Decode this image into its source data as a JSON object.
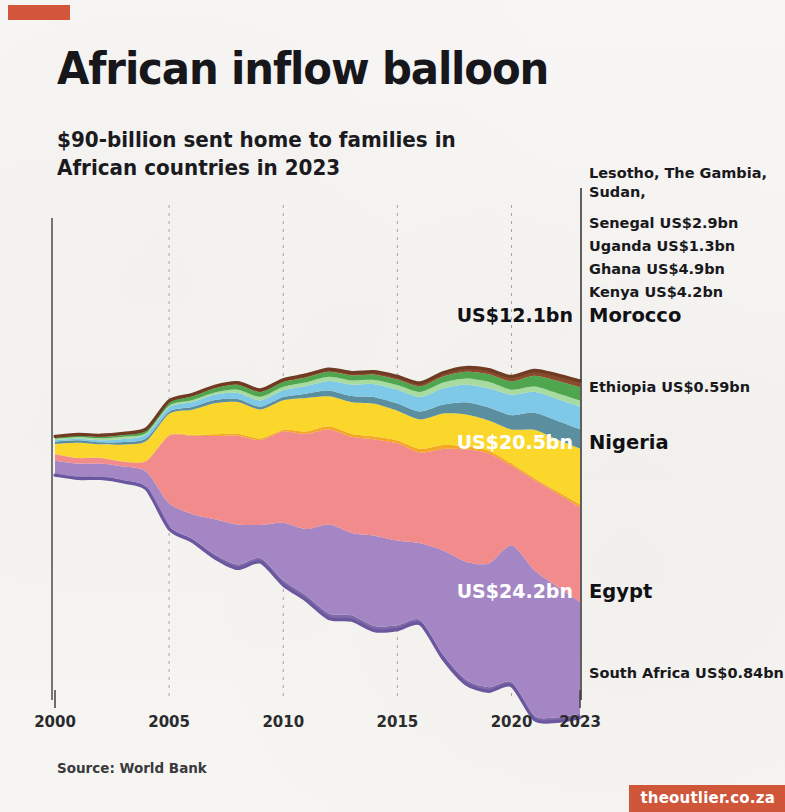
{
  "header": {
    "accent_bar_color": "#d2563a",
    "title": "African inflow balloon",
    "subtitle": "$90-billion sent home to families in\nAfrican countries in 2023"
  },
  "footer": {
    "source": "Source: World Bank",
    "badge": "theoutlier.co.za",
    "badge_color": "#cf5639"
  },
  "chart_data": {
    "type": "area",
    "title": "African inflow balloon",
    "subtitle": "$90-billion sent home to families in African countries in 2023",
    "xlabel": "",
    "ylabel": "",
    "grid": false,
    "legend_position": "right-inline",
    "units": "US$ billions",
    "x": [
      2000,
      2001,
      2002,
      2003,
      2004,
      2005,
      2006,
      2007,
      2008,
      2009,
      2010,
      2011,
      2012,
      2013,
      2014,
      2015,
      2016,
      2017,
      2018,
      2019,
      2020,
      2021,
      2022,
      2023
    ],
    "xticks": [
      "2000",
      "2005",
      "2010",
      "2015",
      "2020",
      "2023"
    ],
    "xtick_values": [
      2000,
      2005,
      2010,
      2015,
      2020,
      2023
    ],
    "stack_order_top_to_bottom": [
      "Lesotho, The Gambia, Sudan",
      "Senegal",
      "Uganda",
      "Ghana",
      "Kenya",
      "Morocco",
      "Ethiopia",
      "Nigeria",
      "Egypt",
      "South Africa"
    ],
    "series": [
      {
        "name": "South Africa",
        "label": "South Africa US$0.84bn",
        "value_2023": 0.84,
        "color": "#7f6aa8",
        "values": [
          0.3,
          0.32,
          0.35,
          0.38,
          0.42,
          0.5,
          0.58,
          0.7,
          0.85,
          0.9,
          1.0,
          1.05,
          1.1,
          1.05,
          1.0,
          0.95,
          0.88,
          0.9,
          0.92,
          0.9,
          0.78,
          0.82,
          0.86,
          0.84
        ]
      },
      {
        "name": "Egypt",
        "label": "Egypt",
        "value_label": "US$24.2bn",
        "value_2023": 24.2,
        "color": "#a586c4",
        "values": [
          2.85,
          2.91,
          2.89,
          2.96,
          3.34,
          5.02,
          5.33,
          7.66,
          8.69,
          7.15,
          12.45,
          14.32,
          19.24,
          17.83,
          19.57,
          18.33,
          16.58,
          22.52,
          25.52,
          26.78,
          29.6,
          31.49,
          28.33,
          24.2
        ]
      },
      {
        "name": "Nigeria",
        "label": "Nigeria",
        "value_label": "US$20.5bn",
        "value_2023": 20.5,
        "color": "#f28c8c",
        "values": [
          1.39,
          1.17,
          1.21,
          1.06,
          2.27,
          14.64,
          16.93,
          18.01,
          19.21,
          18.37,
          19.75,
          20.62,
          20.63,
          20.8,
          20.83,
          21.06,
          19.67,
          22.0,
          24.31,
          23.81,
          17.21,
          19.5,
          20.13,
          20.5
        ]
      },
      {
        "name": "Ethiopia",
        "label": "Ethiopia US$0.59bn",
        "value_2023": 0.59,
        "color": "#f5a623",
        "values": [
          0.05,
          0.05,
          0.06,
          0.1,
          0.13,
          0.17,
          0.17,
          0.36,
          0.39,
          0.35,
          0.35,
          0.51,
          0.62,
          0.63,
          0.65,
          0.62,
          0.77,
          0.85,
          0.68,
          0.59,
          0.48,
          0.42,
          0.48,
          0.59
        ]
      },
      {
        "name": "Morocco",
        "label": "Morocco",
        "value_label": "US$12.1bn",
        "value_2023": 12.1,
        "color": "#fbd72b",
        "values": [
          2.16,
          3.26,
          2.88,
          3.61,
          4.22,
          4.59,
          5.45,
          6.73,
          6.89,
          6.27,
          6.42,
          7.26,
          6.51,
          6.88,
          7.04,
          6.41,
          6.36,
          6.8,
          6.86,
          6.56,
          7.38,
          10.45,
          11.18,
          12.1
        ]
      },
      {
        "name": "Kenya",
        "label": "Kenya US$4.2bn",
        "value_2023": 4.2,
        "color": "#5b8fa0",
        "values": [
          0.54,
          0.55,
          0.43,
          0.54,
          0.62,
          0.43,
          0.57,
          0.67,
          0.67,
          0.61,
          0.69,
          0.93,
          1.22,
          1.31,
          1.44,
          1.57,
          1.72,
          1.95,
          2.67,
          2.82,
          3.09,
          3.72,
          4.09,
          4.2
        ]
      },
      {
        "name": "Ghana",
        "label": "Ghana US$4.9bn",
        "value_2023": 4.9,
        "color": "#7ec8e8",
        "values": [
          0.32,
          0.35,
          0.44,
          0.65,
          0.82,
          0.99,
          1.05,
          1.17,
          1.28,
          1.35,
          1.45,
          1.65,
          2.1,
          2.5,
          2.8,
          2.98,
          3.15,
          3.53,
          3.8,
          4.14,
          4.45,
          4.52,
          4.72,
          4.9
        ]
      },
      {
        "name": "Uganda",
        "label": "Uganda US$1.3bn",
        "value_2023": 1.3,
        "color": "#a8dba0",
        "values": [
          0.24,
          0.31,
          0.42,
          0.49,
          0.31,
          0.32,
          0.41,
          0.45,
          0.72,
          0.78,
          0.77,
          0.82,
          0.91,
          0.9,
          0.95,
          1.05,
          1.1,
          1.25,
          1.35,
          1.42,
          1.08,
          1.12,
          1.22,
          1.3
        ]
      },
      {
        "name": "Senegal",
        "label": "Senegal US$2.9bn",
        "value_2023": 2.9,
        "color": "#4fa64f",
        "values": [
          0.23,
          0.3,
          0.34,
          0.4,
          0.51,
          0.66,
          0.83,
          0.93,
          1.06,
          1.0,
          1.02,
          1.05,
          1.07,
          1.09,
          1.12,
          1.15,
          1.2,
          1.3,
          1.45,
          1.62,
          1.8,
          2.35,
          2.7,
          2.9
        ]
      },
      {
        "name": "Lesotho, The Gambia, Sudan",
        "label": "Lesotho, The Gambia,\nSudan,",
        "color": "#8a4a2e",
        "values": [
          0.32,
          0.33,
          0.34,
          0.36,
          0.38,
          0.4,
          0.42,
          0.45,
          0.48,
          0.5,
          0.52,
          0.54,
          0.58,
          0.62,
          0.66,
          0.7,
          0.75,
          0.82,
          0.9,
          0.98,
          1.05,
          1.18,
          1.28,
          1.35
        ]
      }
    ],
    "right_labels": [
      {
        "id": "lesotho-gambia-sudan",
        "text_line1": "Lesotho, The Gambia,",
        "text_line2": "Sudan,",
        "style": "plain"
      },
      {
        "id": "senegal",
        "text": "Senegal US$2.9bn",
        "style": "plain"
      },
      {
        "id": "uganda",
        "text": "Uganda US$1.3bn",
        "style": "plain"
      },
      {
        "id": "ghana",
        "text": "Ghana US$4.9bn",
        "style": "plain"
      },
      {
        "id": "kenya",
        "text": "Kenya US$4.2bn",
        "style": "plain"
      },
      {
        "id": "morocco",
        "text": "Morocco",
        "value": "US$12.1bn",
        "style": "bold",
        "value_color": "dark"
      },
      {
        "id": "ethiopia",
        "text": "Ethiopia US$0.59bn",
        "style": "plain"
      },
      {
        "id": "nigeria",
        "text": "Nigeria",
        "value": "US$20.5bn",
        "style": "bold",
        "value_color": "light"
      },
      {
        "id": "egypt",
        "text": "Egypt",
        "value": "US$24.2bn",
        "style": "bold",
        "value_color": "light"
      },
      {
        "id": "south-africa",
        "text": "South Africa US$0.84bn",
        "style": "plain"
      }
    ]
  }
}
